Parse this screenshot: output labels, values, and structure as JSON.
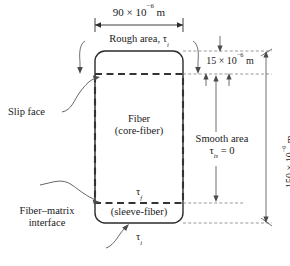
{
  "figure": {
    "name": "fiber-pullout-geometry-diagram",
    "dimensions": {
      "width_label_value": "90 × 10",
      "width_label_exp": "−6",
      "width_label_unit": " m",
      "gap_label_value": "15 × 10",
      "gap_label_exp": "−6",
      "gap_label_unit": " m",
      "height_label_value": "150 × 10",
      "height_label_exp": "−6",
      "height_label_unit": " m"
    },
    "labels": {
      "rough_area_text": "Rough area, ",
      "rough_area_tau": "τ",
      "rough_area_sub": "i",
      "fiber_line1": "Fiber",
      "fiber_line2": "(core-fiber)",
      "sleeve_fiber": "(sleeve-fiber)",
      "tau_f_sym": "τ",
      "tau_f_sub": "f",
      "tau_i_sym": "τ",
      "tau_i_sub": "i",
      "smooth_area_line1": "Smooth area",
      "smooth_area_tau": "τ",
      "smooth_area_sub": "is",
      "smooth_area_eq": " = 0",
      "slip_face": "Slip face",
      "fiber_matrix_line1": "Fiber–matrix",
      "fiber_matrix_line2": "interface"
    },
    "colors": {
      "stroke": "#2b2b2b",
      "dashed_heavy": "#333333",
      "thin": "#4a4a4a",
      "background": "#ffffff"
    }
  }
}
